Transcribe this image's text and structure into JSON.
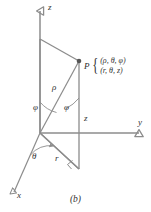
{
  "figure": {
    "caption": "(b)",
    "line_color": "#8c8c8c",
    "text_color": "#333333",
    "background": "#ffffff"
  },
  "axes": [
    {
      "name": "z-axis",
      "label": "z",
      "direction": "up"
    },
    {
      "name": "y-axis",
      "label": "y",
      "direction": "right"
    },
    {
      "name": "x-axis",
      "label": "x",
      "direction": "lower-left"
    }
  ],
  "point": {
    "name": "P",
    "label": "P",
    "spherical": "(ρ, θ, φ)",
    "cylindrical": "(r, θ, z)",
    "brace": "{"
  },
  "annotations": [
    {
      "name": "rho",
      "label": "ρ",
      "description": "radial distance from origin to P"
    },
    {
      "name": "phi-upper",
      "label": "φ",
      "description": "polar angle at z-axis"
    },
    {
      "name": "phi-lower",
      "label": "φ",
      "description": "polar angle between z direction and rho"
    },
    {
      "name": "z-height",
      "label": "z",
      "description": "height of P above xy-plane"
    },
    {
      "name": "theta",
      "label": "θ",
      "description": "azimuthal angle from x-axis"
    },
    {
      "name": "r-radial",
      "label": "r",
      "description": "projection of rho onto xy-plane"
    }
  ]
}
